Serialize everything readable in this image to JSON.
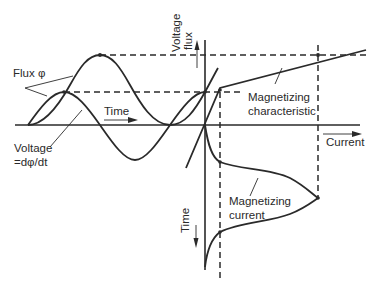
{
  "diagram": {
    "labels": {
      "flux": "Flux φ",
      "voltage_line1": "Voltage",
      "voltage_line2": "=dφ/dt",
      "time_horizontal": "Time",
      "vertical_axis_line1": "Voltage",
      "vertical_axis_line2": "flux",
      "current_axis": "Current",
      "magnetizing_characteristic_line1": "Magnetizing",
      "magnetizing_characteristic_line2": "characteristic",
      "magnetizing_current_line1": "Magnetizing",
      "magnetizing_current_line2": "current",
      "time_vertical": "Time"
    },
    "elements": [
      "flux-waveform (offset sinusoid 1-cos)",
      "voltage-waveform (sinusoid, dφ/dt)",
      "magnetizing-characteristic (piecewise linear, knee at saturation)",
      "magnetizing-current-waveform (peaked, non-sinusoidal)",
      "projection dashed lines"
    ],
    "colors": {
      "ink": "#2a2a2a",
      "background": "#ffffff"
    }
  }
}
